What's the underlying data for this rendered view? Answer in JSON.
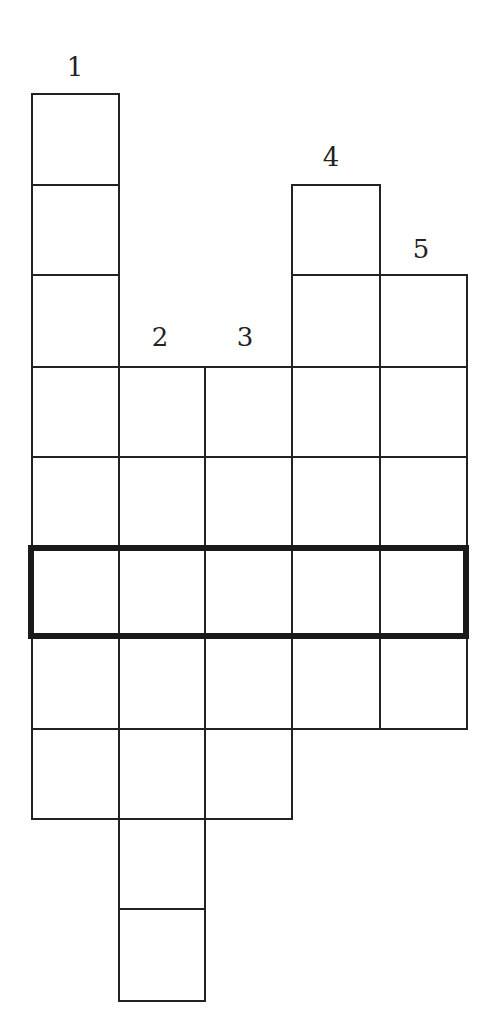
{
  "grid": {
    "col_x": [
      31,
      118,
      204,
      291,
      379,
      466
    ],
    "row_y": [
      93,
      184,
      274,
      366,
      456,
      547,
      637,
      728,
      818,
      908,
      1000
    ],
    "columns": [
      {
        "number": "1",
        "col": 0,
        "start_row": 0,
        "length": 8,
        "label_x": 75,
        "label_y": 67
      },
      {
        "number": "2",
        "col": 1,
        "start_row": 3,
        "length": 7,
        "label_x": 160,
        "label_y": 337
      },
      {
        "number": "3",
        "col": 2,
        "start_row": 3,
        "length": 5,
        "label_x": 245,
        "label_y": 337
      },
      {
        "number": "4",
        "col": 3,
        "start_row": 1,
        "length": 6,
        "label_x": 331,
        "label_y": 157
      },
      {
        "number": "5",
        "col": 4,
        "start_row": 2,
        "length": 5,
        "label_x": 421,
        "label_y": 249
      }
    ],
    "highlighted_row": {
      "row": 5,
      "from_col": 0,
      "to_col": 4
    }
  }
}
